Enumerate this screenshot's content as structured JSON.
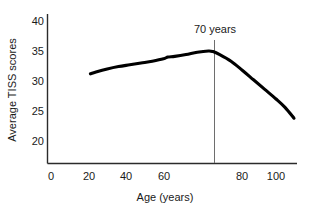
{
  "chart_data": {
    "type": "line",
    "title": "",
    "xlabel": "Age (years)",
    "ylabel": "Average TISS scores",
    "xlim": [
      0,
      112
    ],
    "ylim": [
      17.5,
      41.5
    ],
    "grid": false,
    "legend": null,
    "x_ticks": [
      "0",
      "20",
      "40",
      "60",
      "80",
      "100"
    ],
    "x_tick_values": [
      0,
      20,
      40,
      60,
      80,
      100
    ],
    "y_ticks": [
      "20",
      "25",
      "30",
      "35",
      "40"
    ],
    "y_tick_values": [
      20,
      25,
      30,
      35,
      40
    ],
    "annotations": [
      {
        "label": "70 years",
        "x": 70,
        "type": "vertical-reference-line"
      }
    ],
    "series": [
      {
        "name": "Average TISS score by age",
        "x": [
          17.5,
          20,
          25,
          30,
          35,
          40,
          45,
          50,
          52,
          55,
          60,
          65,
          70,
          72,
          75,
          80,
          85,
          90,
          95,
          100,
          104,
          108
        ],
        "values": [
          31.2,
          31.5,
          32.0,
          32.4,
          32.7,
          33.0,
          33.3,
          33.7,
          34.0,
          34.1,
          34.4,
          34.8,
          35.0,
          34.9,
          34.4,
          33.3,
          31.8,
          30.2,
          28.6,
          27.0,
          25.6,
          23.8
        ]
      }
    ]
  },
  "axis_labels": {
    "y_axis_title": "Average TISS scores",
    "x_axis_title": "Age (years)"
  },
  "colors": {
    "curve": "#000000",
    "axis": "#2b2b2b",
    "marker_line": "#6e6e6e",
    "text": "#1a1a1a",
    "background": "#ffffff"
  }
}
